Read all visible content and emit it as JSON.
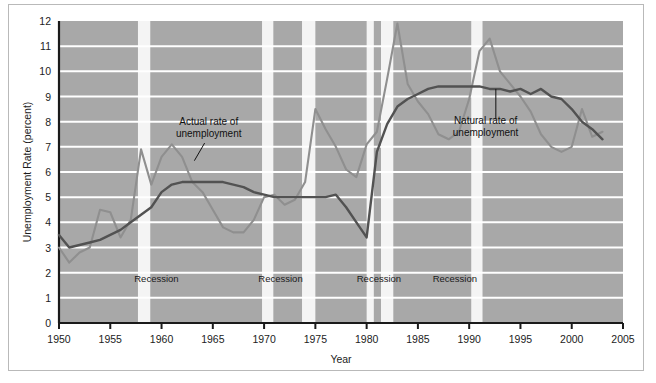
{
  "chart_data": {
    "type": "line",
    "title": "",
    "xlabel": "Year",
    "ylabel": "Unemployment Rate (percent)",
    "xlim": [
      1950,
      2005
    ],
    "ylim": [
      0,
      12
    ],
    "xticks": [
      1950,
      1955,
      1960,
      1965,
      1970,
      1975,
      1980,
      1985,
      1990,
      1995,
      2000,
      2005
    ],
    "yticks": [
      0,
      1,
      2,
      3,
      4,
      5,
      6,
      7,
      8,
      9,
      10,
      11,
      12
    ],
    "grid": "horizontal-white-lines-on-gray-panel",
    "legend_position": "inline-annotations",
    "plot_background": "#a8a8a8",
    "series": [
      {
        "name": "Actual rate of unemployment",
        "color": "#8f8f8f",
        "x": [
          1950,
          1951,
          1952,
          1953,
          1954,
          1955,
          1956,
          1957,
          1958,
          1959,
          1960,
          1961,
          1962,
          1963,
          1964,
          1965,
          1966,
          1967,
          1968,
          1969,
          1970,
          1971,
          1972,
          1973,
          1974,
          1975,
          1976,
          1977,
          1978,
          1979,
          1980,
          1981,
          1982,
          1983,
          1984,
          1985,
          1986,
          1987,
          1988,
          1989,
          1990,
          1991,
          1992,
          1993,
          1994,
          1995,
          1996,
          1997,
          1998,
          1999,
          2000,
          2001,
          2002,
          2003
        ],
        "values": [
          3.0,
          2.4,
          2.8,
          3.0,
          4.5,
          4.4,
          3.4,
          4.1,
          6.9,
          5.5,
          6.6,
          7.1,
          6.6,
          5.6,
          5.2,
          4.5,
          3.8,
          3.6,
          3.6,
          4.1,
          5.0,
          5.1,
          4.7,
          4.9,
          5.6,
          8.5,
          7.7,
          7.0,
          6.1,
          5.8,
          7.1,
          7.6,
          9.7,
          11.9,
          9.5,
          8.8,
          8.3,
          7.5,
          7.3,
          7.6,
          8.9,
          10.8,
          11.3,
          10.0,
          9.5,
          9.0,
          8.4,
          7.5,
          7.0,
          6.8,
          7.0,
          8.5,
          7.4,
          7.6
        ],
        "units": "percent"
      },
      {
        "name": "Natural rate of unemployment",
        "color": "#525252",
        "x": [
          1950,
          1951,
          1952,
          1953,
          1954,
          1955,
          1956,
          1957,
          1958,
          1959,
          1960,
          1961,
          1962,
          1963,
          1964,
          1965,
          1966,
          1967,
          1968,
          1969,
          1970,
          1971,
          1972,
          1973,
          1974,
          1975,
          1976,
          1977,
          1978,
          1979,
          1980,
          1981,
          1982,
          1983,
          1984,
          1985,
          1986,
          1987,
          1988,
          1989,
          1990,
          1991,
          1992,
          1993,
          1994,
          1995,
          1996,
          1997,
          1998,
          1999,
          2000,
          2001,
          2002,
          2003
        ],
        "values": [
          3.5,
          3.0,
          3.1,
          3.2,
          3.3,
          3.5,
          3.7,
          4.0,
          4.3,
          4.6,
          5.2,
          5.5,
          5.6,
          5.6,
          5.6,
          5.6,
          5.6,
          5.5,
          5.4,
          5.2,
          5.1,
          5.0,
          5.0,
          5.0,
          5.0,
          5.0,
          5.0,
          5.1,
          4.6,
          4.0,
          3.4,
          6.8,
          7.9,
          8.6,
          8.9,
          9.1,
          9.3,
          9.4,
          9.4,
          9.4,
          9.4,
          9.4,
          9.3,
          9.3,
          9.2,
          9.3,
          9.1,
          9.3,
          9.0,
          8.9,
          8.5,
          8.0,
          7.7,
          7.3
        ],
        "units": "percent"
      }
    ],
    "recession_bands": [
      {
        "label": "Recession",
        "start": 1957.7,
        "end": 1958.9
      },
      {
        "label": "Recession",
        "start": 1969.8,
        "end": 1970.9
      },
      {
        "label": "Recession",
        "start": 1973.7,
        "end": 1975.0
      },
      {
        "label": "Recession",
        "start": 1980.0,
        "end": 1980.7
      },
      {
        "label": "Recession",
        "start": 1981.4,
        "end": 1982.6
      },
      {
        "label": "Recession",
        "start": 1990.2,
        "end": 1991.3
      }
    ],
    "recession_text_labels": [
      {
        "text": "Recession",
        "x": 1959.5
      },
      {
        "text": "Recession",
        "x": 1971.6
      },
      {
        "text": "Recession",
        "x": 1981.2
      },
      {
        "text": "Recession",
        "x": 1988.6
      }
    ],
    "annotations": [
      {
        "text_line1": "Actual rate of",
        "text_line2": "unemployment",
        "label_x": 1964.6,
        "label_y": 7.85,
        "leader_from_x": 1964.2,
        "leader_from_y": 7.15,
        "leader_to_x": 1963.2,
        "leader_to_y": 6.45
      },
      {
        "text_line1": "Natural rate of",
        "text_line2": "unemployment",
        "label_x": 1991.6,
        "label_y": 7.9,
        "leader_from_x": 1992.6,
        "leader_from_y": 8.1,
        "leader_to_x": 1992.6,
        "leader_to_y": 9.3
      }
    ]
  }
}
